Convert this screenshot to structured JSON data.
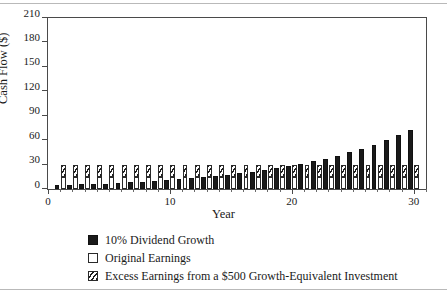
{
  "chart_data": {
    "type": "bar",
    "title": "",
    "subtitle": "",
    "xlabel": "Year",
    "ylabel": "Cash Flow ($)",
    "xlim": [
      0,
      31
    ],
    "ylim": [
      0,
      210
    ],
    "yticks": [
      0,
      30,
      60,
      90,
      120,
      150,
      180,
      210
    ],
    "xticks": [
      0,
      10,
      20,
      30
    ],
    "xtick_labels": [
      "0",
      "10",
      "20",
      "30"
    ],
    "ytick_labels": [
      "0",
      "30",
      "60",
      "90",
      "120",
      "150",
      "180",
      "210"
    ],
    "grid": false,
    "legend_position": "below-center",
    "stacked_second_column": true,
    "categories": [
      1,
      2,
      3,
      4,
      5,
      6,
      7,
      8,
      9,
      10,
      11,
      12,
      13,
      14,
      15,
      16,
      17,
      18,
      19,
      20,
      21,
      22,
      23,
      24,
      25,
      26,
      27,
      28,
      29,
      30
    ],
    "series": [
      {
        "name": "10% Dividend Growth",
        "color": "#1a1a1a",
        "fill": "solid",
        "values": [
          4.6,
          5.1,
          5.6,
          6.1,
          6.7,
          7.4,
          8.1,
          8.9,
          9.8,
          10.8,
          11.9,
          13.1,
          14.4,
          15.8,
          17.4,
          19.1,
          21.0,
          23.1,
          25.5,
          28.0,
          30.8,
          33.9,
          37.3,
          41.0,
          45.1,
          49.6,
          54.6,
          60.1,
          66.1,
          72.7
        ]
      },
      {
        "name": "Original Earnings",
        "color": "#ffffff",
        "fill": "open",
        "values": [
          15,
          15,
          15,
          15,
          15,
          15,
          15,
          15,
          15,
          15,
          15,
          15,
          15,
          15,
          15,
          15,
          15,
          15,
          15,
          15,
          15,
          15,
          15,
          15,
          15,
          15,
          15,
          15,
          15,
          15
        ]
      },
      {
        "name": "Excess Earnings from a $500 Growth-Equivalent Investment",
        "color": "#ffffff",
        "fill": "hatched",
        "values": [
          15,
          15,
          15,
          15,
          15,
          15,
          15,
          15,
          15,
          15,
          15,
          15,
          15,
          15,
          15,
          15,
          15,
          15,
          15,
          15,
          15,
          15,
          15,
          15,
          15,
          15,
          15,
          15,
          15,
          15
        ]
      }
    ]
  },
  "legend": {
    "items": [
      {
        "label": "10% Dividend Growth",
        "swatch": "black"
      },
      {
        "label": "Original Earnings",
        "swatch": "white"
      },
      {
        "label": "Excess Earnings from a $500 Growth-Equivalent Investment",
        "swatch": "hatch"
      }
    ]
  }
}
